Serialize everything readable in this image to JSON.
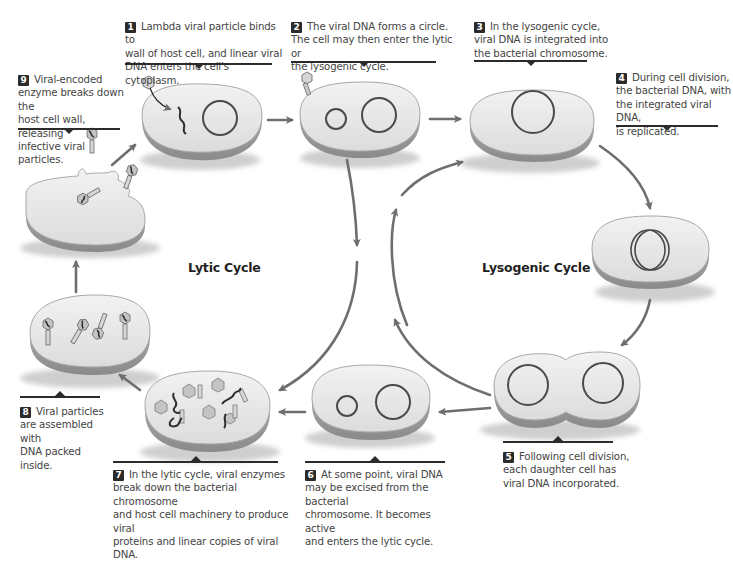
{
  "diagram": {
    "colors": {
      "cell_fill": "#e6e6e6",
      "cell_edge": "#9a9a9a",
      "dna_ring": "#4a4a4a",
      "arrow": "#6e6e6e",
      "rule": "#2b2b2b",
      "text": "#444444"
    },
    "cycle_labels": {
      "lytic": "Lytic Cycle",
      "lysogenic": "Lysogenic Cycle"
    },
    "steps": [
      {
        "number": "1",
        "text": "Lambda viral particle binds to wall of host cell, and linear viral DNA enters the cell's cytoplasm."
      },
      {
        "number": "2",
        "text": "The viral DNA forms a circle. The cell may then enter the lytic or the lysogenic cycle."
      },
      {
        "number": "3",
        "text": "In the lysogenic cycle, viral DNA is integrated into the bacterial chromosome."
      },
      {
        "number": "4",
        "text": "During cell division, the bacterial DNA, with the integrated viral DNA, is replicated."
      },
      {
        "number": "5",
        "text": "Following cell division, each daughter cell has viral DNA incorporated."
      },
      {
        "number": "6",
        "text": "At some point, viral DNA may be excised from the bacterial chromosome. It becomes active and enters the lytic cycle."
      },
      {
        "number": "7",
        "text": "In the lytic cycle, viral enzymes break down the bacterial chromosome and host cell machinery to produce viral proteins and linear copies of viral DNA."
      },
      {
        "number": "8",
        "text": "Viral particles are assembled with DNA packed inside."
      },
      {
        "number": "9",
        "text": "Viral-encoded enzyme breaks down the host cell wall, releasing infective viral particles."
      }
    ],
    "lines": {
      "s1": [
        "Lambda viral particle binds to",
        "wall of host cell, and linear viral",
        "DNA enters the cell's cytoplasm."
      ],
      "s2": [
        "The viral DNA forms a circle.",
        "The cell may then enter the lytic or",
        "the lysogenic cycle."
      ],
      "s3": [
        "In the lysogenic cycle,",
        "viral DNA is integrated into",
        "the bacterial chromosome."
      ],
      "s4": [
        "During cell division,",
        "the bacterial DNA, with",
        "the integrated viral DNA,",
        "is replicated."
      ],
      "s5": [
        "Following cell division,",
        "each daughter cell has",
        "viral DNA incorporated."
      ],
      "s6": [
        "At some point, viral DNA",
        "may be excised from the bacterial",
        "chromosome. It becomes active",
        "and enters the lytic cycle."
      ],
      "s7": [
        "In the lytic cycle, viral enzymes",
        "break down the bacterial chromosome",
        "and host cell machinery to produce viral",
        "proteins and linear copies of viral DNA."
      ],
      "s8": [
        "Viral particles",
        "are assembled with",
        "DNA packed inside."
      ],
      "s9": [
        "Viral-encoded",
        "enzyme breaks down the",
        "host cell wall, releasing",
        "infective viral particles."
      ]
    }
  }
}
